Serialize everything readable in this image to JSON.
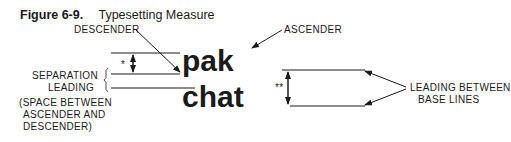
{
  "figure": {
    "number": "Figure 6-9.",
    "title": "Typesetting Measure"
  },
  "labels": {
    "descender": "DESCENDER",
    "ascender": "ASCENDER",
    "separation_leading_line1": "SEPARATION",
    "separation_leading_line2": "LEADING",
    "note_line1": "(SPACE BETWEEN",
    "note_line2": "ASCENDER AND",
    "note_line3": "DESCENDER)",
    "leading_between_line1": "LEADING BETWEEN",
    "leading_between_line2": "BASE LINES",
    "single_mark": "*",
    "double_mark": "**"
  },
  "sample_words": {
    "top": "pak",
    "bottom": "chat"
  }
}
